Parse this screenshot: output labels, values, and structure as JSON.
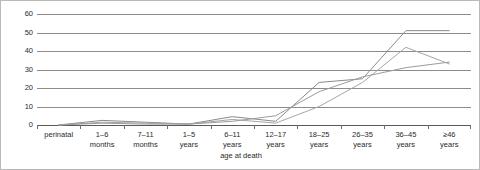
{
  "chart_data": {
    "type": "line",
    "title": "",
    "xlabel": "age at death",
    "ylabel": "",
    "ylim": [
      0,
      60
    ],
    "ytick_values": [
      60,
      50,
      40,
      30,
      20,
      10,
      0
    ],
    "ytick_labels": [
      "60",
      "50",
      "40",
      "30",
      "20",
      "10",
      "0"
    ],
    "grid": true,
    "legend": "none",
    "categories": [
      "perinatal",
      "1–6\nmonths",
      "7–11\nmonths",
      "1–5\nyears",
      "6–11\nyears",
      "12–17\nyears",
      "18–25\nyears",
      "26–35\nyears",
      "36–45\nyears",
      "≥46\nyears"
    ],
    "series": [
      {
        "name": "series-1",
        "color": "#8a8a8a",
        "values": [
          0,
          2.5,
          1.5,
          0.5,
          4.5,
          2,
          23,
          25,
          51,
          51
        ]
      },
      {
        "name": "series-2",
        "color": "#a6a6a6",
        "values": [
          0,
          1.5,
          1,
          0.5,
          3,
          1,
          10,
          23,
          42,
          33
        ]
      },
      {
        "name": "series-3",
        "color": "#9c9c9c",
        "values": [
          0,
          1,
          0.5,
          0.5,
          2,
          5,
          18,
          26,
          31,
          34
        ]
      }
    ]
  }
}
